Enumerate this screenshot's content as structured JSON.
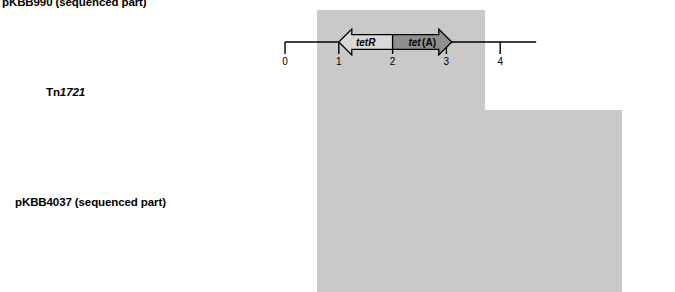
{
  "figure": {
    "type": "genetic-map-diagram",
    "title_rows": [
      {
        "id": "top",
        "label": "pKBB990 (sequenced part)",
        "italic_part": ""
      },
      {
        "id": "middle",
        "label": "Tn1721",
        "prefix": "Tn",
        "italic_part": "1721"
      },
      {
        "id": "bottom",
        "label": "pKBB4037 (sequenced part)",
        "italic_part": ""
      }
    ],
    "colors": {
      "highlight_band": "#c9c9c9",
      "tetR_fill": "#d9d9d9",
      "tetA_fill": "#8f8f8f",
      "tnpA_fill": "#ededed",
      "white_fill": "#ffffff",
      "black_bar": "#000000",
      "line": "#000000"
    }
  },
  "rows": {
    "top": {
      "name": "pKBB990 (sequenced part)",
      "scale_ticks": [
        "0",
        "1",
        "2",
        "3",
        "4"
      ],
      "genes": [
        {
          "label": "tetR",
          "sub": "",
          "direction": "left",
          "fill": "tetR_fill",
          "start": 1.0,
          "end": 2.0
        },
        {
          "label": "tet",
          "sub": "(A)",
          "direction": "right",
          "fill": "tetA_fill",
          "start": 2.0,
          "end": 3.1
        }
      ],
      "black_bars": []
    },
    "middle": {
      "name": "Tn1721",
      "scale_ticks": [
        "0",
        "1",
        "2",
        "3",
        "4",
        "5",
        "6",
        "7",
        "8",
        "9",
        "10",
        "11"
      ],
      "genes": [
        {
          "label": "mcp",
          "sub": "",
          "direction": "left",
          "fill": "white_fill",
          "start": 0.2,
          "end": 2.0
        },
        {
          "label": "tnpR",
          "sub": "",
          "direction": "right",
          "fill": "white_fill",
          "start": 2.1,
          "end": 3.1
        },
        {
          "label": "tnpA",
          "sub": "",
          "direction": "right",
          "fill": "tnpA_fill",
          "start": 3.1,
          "end": 5.35
        },
        {
          "label": "tetR",
          "sub": "",
          "direction": "left",
          "fill": "tetR_fill",
          "start": 5.6,
          "end": 6.65
        },
        {
          "label": "tet",
          "sub": "(A)",
          "direction": "right",
          "fill": "tetA_fill",
          "start": 6.7,
          "end": 7.8
        },
        {
          "label": "ΔtnpA",
          "sub": "",
          "direction": "right",
          "fill": "tnpA_fill",
          "start": 9.3,
          "end": 11.0
        }
      ],
      "black_bars": [
        {
          "position": 0.05,
          "width": 0.22
        },
        {
          "position": 5.42,
          "width": 0.22
        },
        {
          "position": 11.0,
          "width": 0.22
        }
      ]
    },
    "bottom": {
      "name": "pKBB4037 (sequenced part)",
      "scale_ticks": [
        "0",
        "1",
        "2",
        "3",
        "4",
        "5",
        "6",
        "7",
        "8",
        "9",
        "10",
        "11"
      ],
      "genes": [
        {
          "label": "res",
          "sub": "",
          "direction": "right",
          "fill": "white_fill",
          "start": 0.35,
          "end": 1.18
        },
        {
          "label": "parA1",
          "sub": "",
          "direction": "right",
          "fill": "white_fill",
          "start": 1.28,
          "end": 2.0
        },
        {
          "label": "parC",
          "sub": "",
          "direction": "right",
          "fill": "white_fill",
          "start": 2.07,
          "end": 2.72
        },
        {
          "label": "rep",
          "sub": "",
          "direction": "right",
          "fill": "white_fill",
          "start": 2.85,
          "end": 4.4
        },
        {
          "label": "tetR",
          "sub": "",
          "direction": "left",
          "fill": "tetR_fill",
          "start": 5.6,
          "end": 6.65
        },
        {
          "label": "tet",
          "sub": "(A)",
          "direction": "right",
          "fill": "tetA_fill",
          "start": 6.7,
          "end": 7.8
        },
        {
          "label": "ΔtnpA",
          "sub": "",
          "direction": "right",
          "fill": "tnpA_fill",
          "start": 9.3,
          "end": 11.0
        },
        {
          "label": "ΔtnpA*",
          "sub": "",
          "direction": "right",
          "fill": "white_fill",
          "start": 10.9,
          "end": 11.9
        }
      ],
      "black_bars": [
        {
          "position": 10.83,
          "width": 0.22
        }
      ]
    }
  },
  "highlight_band": {
    "label": "conserved-tetR-tetA-region",
    "upper_left_unit": 5.0,
    "upper_right_unit": 9.0,
    "lower_right_unit": 11.5
  }
}
